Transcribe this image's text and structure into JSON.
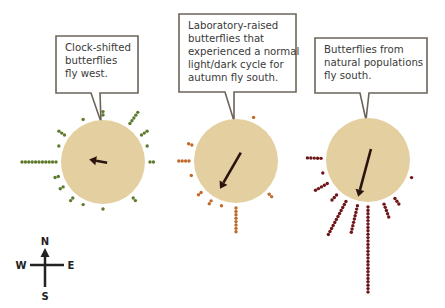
{
  "figure": {
    "background": "#ffffff",
    "circle_fill": "#e3cf9f",
    "arrow_color": "#2a1410",
    "bubble_stroke": "#6b6459",
    "panels": [
      {
        "id": "clock-shifted",
        "label_lines": [
          "Clock-shifted",
          "butterflies",
          "fly west."
        ],
        "dot_color": "#5e7a2c",
        "center": [
          103,
          162
        ],
        "radius": 42,
        "arrow_bearing": 280,
        "arrow_length": 14,
        "bubble": {
          "x": 56,
          "y": 36,
          "w": 82,
          "h": 57,
          "tail_x": 94
        },
        "rays": [
          {
            "bearing": 0,
            "count": 2
          },
          {
            "bearing": 35,
            "count": 5
          },
          {
            "bearing": 55,
            "count": 3
          },
          {
            "bearing": 70,
            "count": 1
          },
          {
            "bearing": 90,
            "count": 2
          },
          {
            "bearing": 140,
            "count": 2
          },
          {
            "bearing": 180,
            "count": 1
          },
          {
            "bearing": 205,
            "count": 1
          },
          {
            "bearing": 220,
            "count": 2
          },
          {
            "bearing": 238,
            "count": 2
          },
          {
            "bearing": 252,
            "count": 2
          },
          {
            "bearing": 270,
            "count": 11
          },
          {
            "bearing": 290,
            "count": 1
          },
          {
            "bearing": 305,
            "count": 3
          },
          {
            "bearing": 335,
            "count": 1
          }
        ]
      },
      {
        "id": "lab-raised",
        "label_lines": [
          "Laboratory-raised",
          "butterflies that",
          "experienced a normal",
          "light/dark cycle for",
          "autumn fly south."
        ],
        "dot_color": "#c2692a",
        "center": [
          236,
          161
        ],
        "radius": 42,
        "arrow_bearing": 210,
        "arrow_length": 32,
        "bubble": {
          "x": 179,
          "y": 14,
          "w": 117,
          "h": 78,
          "tail_x": 228
        },
        "rays": [
          {
            "bearing": 22,
            "count": 1
          },
          {
            "bearing": 135,
            "count": 2
          },
          {
            "bearing": 180,
            "count": 8
          },
          {
            "bearing": 198,
            "count": 1
          },
          {
            "bearing": 212,
            "count": 2
          },
          {
            "bearing": 228,
            "count": 2
          },
          {
            "bearing": 252,
            "count": 1
          },
          {
            "bearing": 270,
            "count": 4
          },
          {
            "bearing": 290,
            "count": 2
          }
        ]
      },
      {
        "id": "natural",
        "label_lines": [
          "Butterflies from",
          "natural populations",
          "fly south."
        ],
        "dot_color": "#6e1518",
        "center": [
          368,
          160
        ],
        "radius": 42,
        "arrow_bearing": 195,
        "arrow_length": 38,
        "bubble": {
          "x": 315,
          "y": 38,
          "w": 112,
          "h": 55,
          "tail_x": 363
        },
        "rays": [
          {
            "bearing": 112,
            "count": 1
          },
          {
            "bearing": 145,
            "count": 3
          },
          {
            "bearing": 160,
            "count": 5
          },
          {
            "bearing": 180,
            "count": 26
          },
          {
            "bearing": 193,
            "count": 9
          },
          {
            "bearing": 208,
            "count": 12
          },
          {
            "bearing": 222,
            "count": 3
          },
          {
            "bearing": 240,
            "count": 5
          },
          {
            "bearing": 254,
            "count": 1
          },
          {
            "bearing": 272,
            "count": 5
          }
        ]
      }
    ],
    "compass": {
      "center": [
        45,
        267
      ],
      "labels": {
        "n": "N",
        "s": "S",
        "e": "E",
        "w": "W"
      }
    }
  }
}
